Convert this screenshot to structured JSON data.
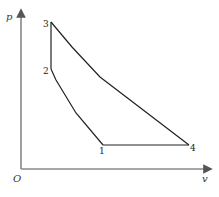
{
  "diagram": {
    "type": "p-v cycle diagram",
    "axes": {
      "y_label": "p",
      "x_label": "v",
      "origin_label": "O"
    },
    "points": [
      {
        "id": "1",
        "label": "1",
        "x": 103,
        "y": 145
      },
      {
        "id": "2",
        "label": "2",
        "x": 51,
        "y": 69
      },
      {
        "id": "3",
        "label": "3",
        "x": 51,
        "y": 22
      },
      {
        "id": "4",
        "label": "4",
        "x": 189,
        "y": 145
      }
    ],
    "processes": [
      {
        "from": "1",
        "to": "2",
        "shape": "curve"
      },
      {
        "from": "2",
        "to": "3",
        "shape": "vertical line"
      },
      {
        "from": "3",
        "to": "4",
        "shape": "curve"
      },
      {
        "from": "4",
        "to": "1",
        "shape": "horizontal line"
      }
    ],
    "caption": ""
  }
}
